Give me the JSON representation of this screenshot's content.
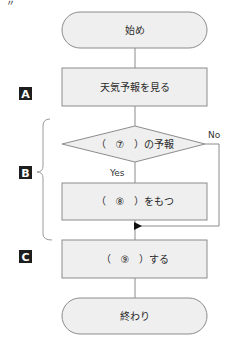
{
  "header": {
    "mark": "〃"
  },
  "colors": {
    "box_fill": "#efefef",
    "stroke": "#8c8c8c",
    "tag_fill": "#1e1e1e"
  },
  "flowchart": {
    "start": "始め",
    "step_a": "天気予報を見る",
    "decision": "（　⑦　）の予報",
    "decision_yes": "Yes",
    "decision_no": "No",
    "step_b": "（　⑧　）をもつ",
    "step_c": "（　⑨　）する",
    "end": "終わり"
  },
  "tags": {
    "a": "A",
    "b": "B",
    "c": "C"
  }
}
